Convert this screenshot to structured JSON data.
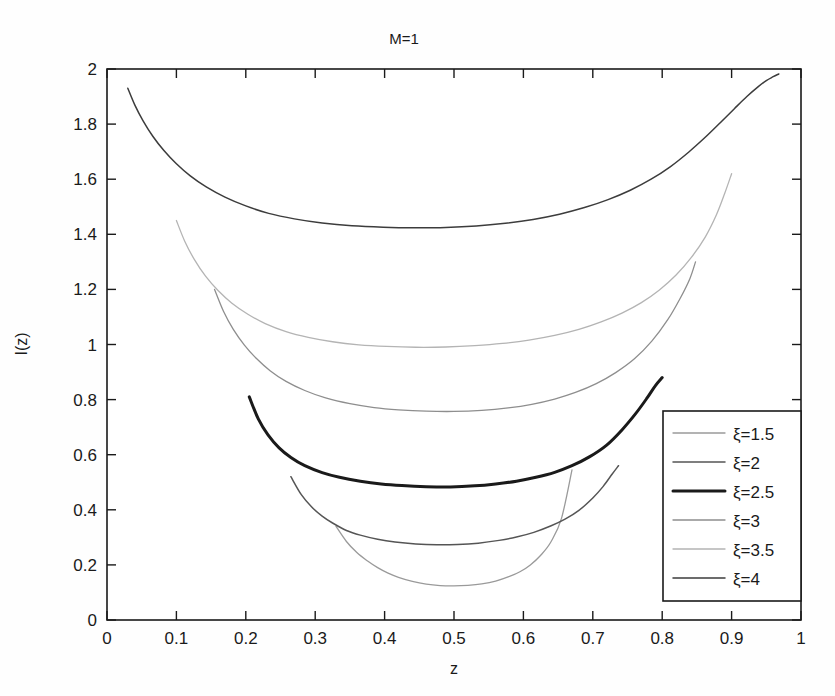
{
  "chart_data": {
    "type": "line",
    "title": "M=1",
    "xlabel": "z",
    "ylabel": "I(z)",
    "xlim": [
      0,
      1
    ],
    "ylim": [
      0,
      2
    ],
    "grid": false,
    "legend_position": "lower-right-inside",
    "xticks": [
      "0",
      "0.1",
      "0.2",
      "0.3",
      "0.4",
      "0.5",
      "0.6",
      "0.7",
      "0.8",
      "0.9",
      "1"
    ],
    "xtick_values": [
      0,
      0.1,
      0.2,
      0.3,
      0.4,
      0.5,
      0.6,
      0.7,
      0.8,
      0.9,
      1
    ],
    "yticks": [
      "0",
      "0.2",
      "0.4",
      "0.6",
      "0.8",
      "1",
      "1.2",
      "1.4",
      "1.6",
      "1.8",
      "2"
    ],
    "ytick_values": [
      0,
      0.2,
      0.4,
      0.6,
      0.8,
      1,
      1.2,
      1.4,
      1.6,
      1.8,
      2
    ],
    "series": [
      {
        "name": "ξ=1.5",
        "color": "#9a9a9a",
        "width": 1.3,
        "x": [
          0.33,
          0.345,
          0.36,
          0.375,
          0.39,
          0.405,
          0.42,
          0.44,
          0.46,
          0.48,
          0.5,
          0.52,
          0.54,
          0.56,
          0.58,
          0.595,
          0.61,
          0.625,
          0.64,
          0.655,
          0.67
        ],
        "y": [
          0.34,
          0.285,
          0.245,
          0.215,
          0.19,
          0.17,
          0.155,
          0.14,
          0.13,
          0.125,
          0.124,
          0.126,
          0.131,
          0.141,
          0.158,
          0.175,
          0.2,
          0.235,
          0.285,
          0.37,
          0.545
        ]
      },
      {
        "name": "ξ=2",
        "color": "#555555",
        "width": 1.5,
        "x": [
          0.265,
          0.28,
          0.295,
          0.31,
          0.325,
          0.345,
          0.365,
          0.39,
          0.415,
          0.445,
          0.475,
          0.505,
          0.535,
          0.565,
          0.59,
          0.615,
          0.64,
          0.66,
          0.68,
          0.7,
          0.715,
          0.728,
          0.737
        ],
        "y": [
          0.52,
          0.455,
          0.41,
          0.377,
          0.352,
          0.325,
          0.308,
          0.293,
          0.283,
          0.276,
          0.273,
          0.274,
          0.279,
          0.289,
          0.301,
          0.318,
          0.342,
          0.366,
          0.398,
          0.443,
          0.485,
          0.53,
          0.56
        ]
      },
      {
        "name": "ξ=2.5",
        "color": "#1a1a1a",
        "width": 3.0,
        "x": [
          0.205,
          0.218,
          0.232,
          0.248,
          0.265,
          0.285,
          0.31,
          0.335,
          0.365,
          0.395,
          0.425,
          0.46,
          0.495,
          0.53,
          0.56,
          0.59,
          0.618,
          0.645,
          0.67,
          0.695,
          0.72,
          0.742,
          0.762,
          0.778,
          0.79,
          0.8
        ],
        "y": [
          0.81,
          0.73,
          0.672,
          0.625,
          0.59,
          0.56,
          0.535,
          0.518,
          0.504,
          0.494,
          0.488,
          0.484,
          0.483,
          0.487,
          0.494,
          0.504,
          0.518,
          0.536,
          0.56,
          0.592,
          0.635,
          0.69,
          0.75,
          0.805,
          0.85,
          0.88
        ]
      },
      {
        "name": "ξ=3",
        "color": "#8e8e8e",
        "width": 1.3,
        "x": [
          0.155,
          0.168,
          0.182,
          0.198,
          0.215,
          0.235,
          0.258,
          0.285,
          0.315,
          0.35,
          0.385,
          0.42,
          0.46,
          0.5,
          0.54,
          0.578,
          0.612,
          0.645,
          0.675,
          0.705,
          0.733,
          0.76,
          0.785,
          0.808,
          0.826,
          0.84,
          0.848
        ],
        "y": [
          1.2,
          1.12,
          1.055,
          0.998,
          0.95,
          0.905,
          0.866,
          0.833,
          0.806,
          0.785,
          0.771,
          0.763,
          0.758,
          0.757,
          0.761,
          0.77,
          0.783,
          0.802,
          0.826,
          0.858,
          0.898,
          0.948,
          1.012,
          1.09,
          1.168,
          1.24,
          1.3
        ]
      },
      {
        "name": "ξ=3.5",
        "color": "#b4b4b4",
        "width": 1.3,
        "x": [
          0.1,
          0.112,
          0.126,
          0.142,
          0.16,
          0.18,
          0.203,
          0.228,
          0.258,
          0.29,
          0.325,
          0.363,
          0.403,
          0.445,
          0.488,
          0.53,
          0.57,
          0.608,
          0.645,
          0.68,
          0.712,
          0.742,
          0.77,
          0.796,
          0.82,
          0.842,
          0.862,
          0.878,
          0.89,
          0.9
        ],
        "y": [
          1.45,
          1.375,
          1.308,
          1.248,
          1.196,
          1.15,
          1.11,
          1.076,
          1.047,
          1.026,
          1.01,
          0.999,
          0.993,
          0.99,
          0.991,
          0.996,
          1.004,
          1.016,
          1.033,
          1.055,
          1.082,
          1.114,
          1.152,
          1.198,
          1.252,
          1.316,
          1.39,
          1.47,
          1.548,
          1.62
        ]
      },
      {
        "name": "ξ=4",
        "color": "#3c3c3c",
        "width": 1.5,
        "x": [
          0.03,
          0.04,
          0.052,
          0.066,
          0.082,
          0.1,
          0.12,
          0.143,
          0.17,
          0.2,
          0.233,
          0.27,
          0.31,
          0.353,
          0.398,
          0.443,
          0.488,
          0.532,
          0.574,
          0.614,
          0.652,
          0.688,
          0.722,
          0.754,
          0.784,
          0.812,
          0.838,
          0.862,
          0.884,
          0.904,
          0.922,
          0.938,
          0.95,
          0.96,
          0.968
        ],
        "y": [
          1.93,
          1.87,
          1.812,
          1.756,
          1.704,
          1.656,
          1.612,
          1.572,
          1.535,
          1.503,
          1.476,
          1.456,
          1.441,
          1.431,
          1.426,
          1.424,
          1.425,
          1.43,
          1.44,
          1.454,
          1.473,
          1.497,
          1.526,
          1.56,
          1.6,
          1.646,
          1.698,
          1.752,
          1.806,
          1.856,
          1.9,
          1.935,
          1.958,
          1.972,
          1.982
        ]
      }
    ]
  },
  "legend": {
    "items": [
      {
        "label": "ξ=1.5"
      },
      {
        "label": "ξ=2"
      },
      {
        "label": "ξ=2.5"
      },
      {
        "label": "ξ=3"
      },
      {
        "label": "ξ=3.5"
      },
      {
        "label": "ξ=4"
      }
    ]
  }
}
